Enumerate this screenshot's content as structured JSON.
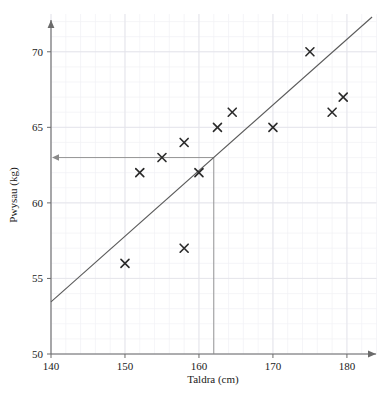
{
  "chart_data": {
    "type": "scatter",
    "title": "",
    "xlabel": "Taldra (cm)",
    "ylabel": "Pwysau (kg)",
    "xlim": [
      140,
      184
    ],
    "ylim": [
      50,
      72.5
    ],
    "xticks": [
      140,
      150,
      160,
      170,
      180
    ],
    "yticks": [
      50,
      55,
      60,
      65,
      70
    ],
    "xtick_labels": [
      "140",
      "150",
      "160",
      "170",
      "180"
    ],
    "ytick_labels": [
      "50",
      "55",
      "60",
      "65",
      "70"
    ],
    "grid": true,
    "grid_minor": true,
    "legend": "none",
    "marker": "x",
    "points": [
      {
        "x": 150,
        "y": 56
      },
      {
        "x": 152,
        "y": 62
      },
      {
        "x": 155,
        "y": 63
      },
      {
        "x": 158,
        "y": 57
      },
      {
        "x": 158,
        "y": 64
      },
      {
        "x": 160,
        "y": 62
      },
      {
        "x": 162.5,
        "y": 65
      },
      {
        "x": 164.5,
        "y": 66
      },
      {
        "x": 170,
        "y": 65
      },
      {
        "x": 175,
        "y": 70
      },
      {
        "x": 178,
        "y": 66
      },
      {
        "x": 179.5,
        "y": 67
      }
    ],
    "trend_line": {
      "name": "line-of-best-fit",
      "x1": 140,
      "y1": 53.45,
      "x2": 183.4,
      "y2": 72.3
    },
    "construction_lines": {
      "vertical_x": 162,
      "horizontal_y": 63,
      "arrow_direction": "left",
      "description": "reading-off lines from x=162 up to the line of best fit then across to y-axis"
    },
    "colors": {
      "background": "#ffffff",
      "grid_major": "#e3e3ea",
      "grid_minor": "#f1f1f5",
      "axis": "#6b6b6b",
      "marker": "#2a2a2a",
      "trend_line": "#5a5a5a",
      "construction_line": "#8a8a8a",
      "text": "#1a1a1a"
    }
  }
}
